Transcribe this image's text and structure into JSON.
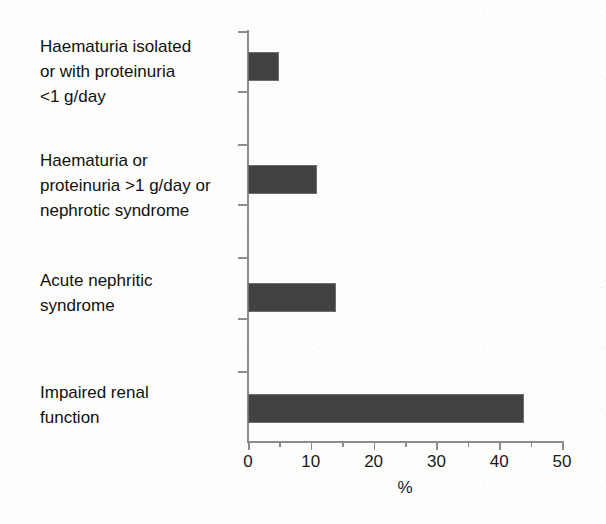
{
  "chart_data": {
    "type": "bar",
    "orientation": "horizontal",
    "title": "",
    "xlabel": "%",
    "ylabel": "",
    "xlim": [
      0,
      50
    ],
    "xticks": [
      0,
      10,
      20,
      30,
      40,
      50
    ],
    "xtick_labels": [
      "0",
      "10",
      "20",
      "30",
      "40",
      "50"
    ],
    "minor_tick_step": 5,
    "grid": false,
    "legend": false,
    "bar_color": "#424242",
    "axis_color": "#8c8c8c",
    "background_color": "#fdfdfb",
    "categories": [
      "Haematuria isolated\nor with proteinuria\n<1 g/day",
      "Haematuria or\nproteinuria >1 g/day or\nnephrotic syndrome",
      "Acute nephritic\nsyndrome",
      "Impaired renal\nfunction"
    ],
    "values": [
      5,
      11,
      14,
      44
    ]
  },
  "axis": {
    "x_title": "%",
    "tick_labels": [
      "0",
      "10",
      "20",
      "30",
      "40",
      "50"
    ]
  },
  "categories": [
    {
      "label": "Haematuria isolated\nor with proteinuria\n<1 g/day",
      "value": 5
    },
    {
      "label": "Haematuria or\nproteinuria >1 g/day or\nnephrotic syndrome",
      "value": 11
    },
    {
      "label": "Acute nephritic\nsyndrome",
      "value": 14
    },
    {
      "label": "Impaired renal\nfunction",
      "value": 44
    }
  ]
}
